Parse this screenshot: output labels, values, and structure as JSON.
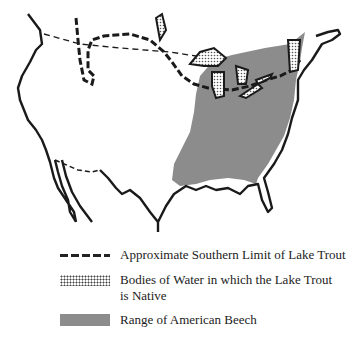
{
  "map": {
    "region": "United States and southern Canada outline",
    "colors": {
      "outline": "#1a1a1a",
      "beech_range": "#8c8c8c",
      "background": "#ffffff"
    },
    "layers": [
      "Country outline (USA)",
      "Approximate southern limit of lake trout (dashed line)",
      "Great Lakes and other native lake trout waters (stippled)",
      "Range of American Beech (gray fill)"
    ]
  },
  "legend": {
    "items": [
      {
        "symbol": "dashed-line",
        "label": "Approximate Southern Limit of Lake Trout"
      },
      {
        "symbol": "stipple",
        "label": "Bodies of Water in which the Lake Trout is Native"
      },
      {
        "symbol": "gray-fill",
        "label": "Range of American Beech"
      }
    ]
  }
}
